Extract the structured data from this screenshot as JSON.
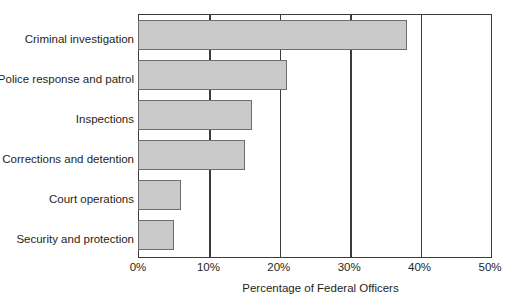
{
  "chart_data": {
    "type": "bar",
    "orientation": "horizontal",
    "title": "",
    "xlabel": "Percentage of Federal Officers",
    "ylabel": "",
    "categories": [
      "Criminal investigation",
      "Police response and patrol",
      "Inspections",
      "Corrections and detention",
      "Court operations",
      "Security and protection"
    ],
    "values": [
      38,
      21,
      16,
      15,
      6,
      5
    ],
    "value_labels": [
      "38%",
      "21%",
      "16%",
      "15%",
      "6%",
      "5%"
    ],
    "xlim": [
      0,
      50
    ],
    "xticks": [
      0,
      10,
      20,
      30,
      40,
      50
    ],
    "xtick_labels": [
      "0%",
      "10%",
      "20%",
      "30%",
      "40%",
      "50%"
    ],
    "grid": "vertical",
    "legend": "none",
    "colors": {
      "bar_fill": "#c9c9c9",
      "bar_stroke": "#6e6e6e",
      "axis": "#3b3b3b",
      "text": "#231f20",
      "background": "#ffffff"
    }
  }
}
